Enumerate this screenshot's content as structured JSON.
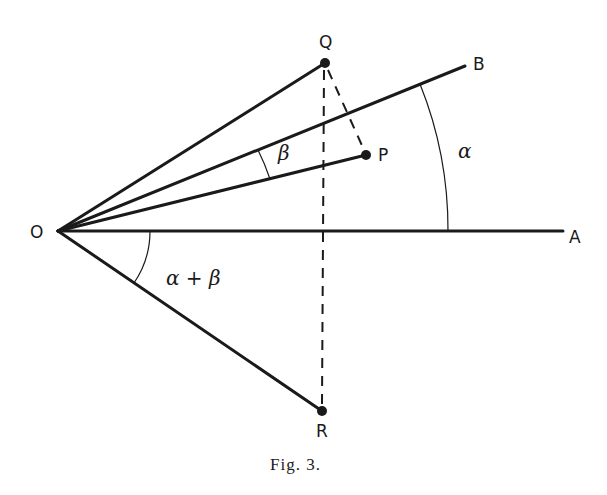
{
  "figure": {
    "caption": "Fig. 3.",
    "points": {
      "O": {
        "label": "O",
        "x": 58,
        "y": 231
      },
      "A": {
        "label": "A",
        "x": 563,
        "y": 231
      },
      "B": {
        "label": "B",
        "x": 465,
        "y": 66
      },
      "Q": {
        "label": "Q",
        "x": 325,
        "y": 63
      },
      "P": {
        "label": "P",
        "x": 366,
        "y": 155
      },
      "R": {
        "label": "R",
        "x": 322,
        "y": 411
      }
    },
    "angles": {
      "alpha": {
        "label": "α",
        "from": "OA",
        "to": "OB"
      },
      "beta": {
        "label": "β",
        "from": "OP",
        "to": "OB"
      },
      "alpha_plus_beta": {
        "label": "α + β",
        "from": "OA",
        "to": "OR"
      }
    },
    "segments": {
      "solid": [
        "OA",
        "OB",
        "OQ",
        "OP",
        "OR"
      ],
      "dashed": [
        "QR",
        "QP"
      ]
    },
    "colors": {
      "ink": "#1a1a1a",
      "background": "#ffffff"
    }
  }
}
